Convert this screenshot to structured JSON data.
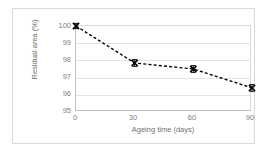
{
  "chart_data": {
    "type": "line",
    "title": "",
    "xlabel": "Ageing time (days)",
    "ylabel": "Residual area (%)",
    "x": [
      0,
      30,
      60,
      90
    ],
    "values": [
      100.0,
      97.85,
      97.5,
      96.4
    ],
    "errors": [
      0.15,
      0.2,
      0.2,
      0.2
    ],
    "series": [
      {
        "name": "Residual area",
        "values": [
          100.0,
          97.85,
          97.5,
          96.4
        ],
        "marker": "x",
        "linestyle": "dashed",
        "color": "#000000"
      }
    ],
    "xlim": [
      0,
      90
    ],
    "ylim": [
      95,
      100
    ],
    "xticks": [
      "0",
      "30",
      "60",
      "90"
    ],
    "yticks": [
      "100",
      "99",
      "98",
      "97",
      "96",
      "95"
    ],
    "grid": "horizontal",
    "legend": "none"
  },
  "axes": {
    "y_label": "Residual area (%)",
    "x_label": "Ageing time (days)",
    "y_ticks": [
      {
        "label": "100",
        "value": 100
      },
      {
        "label": "99",
        "value": 99
      },
      {
        "label": "98",
        "value": 98
      },
      {
        "label": "97",
        "value": 97
      },
      {
        "label": "96",
        "value": 96
      },
      {
        "label": "95",
        "value": 95
      }
    ],
    "x_ticks": [
      {
        "label": "0",
        "value": 0
      },
      {
        "label": "30",
        "value": 30
      },
      {
        "label": "60",
        "value": 60
      },
      {
        "label": "90",
        "value": 90
      }
    ]
  },
  "colors": {
    "series_line": "#000000",
    "gridline": "#e2e2e2",
    "axis": "#bfbfbf",
    "tick_text": "#7f7f7f",
    "frame": "#d9d9d9",
    "background": "#ffffff"
  }
}
